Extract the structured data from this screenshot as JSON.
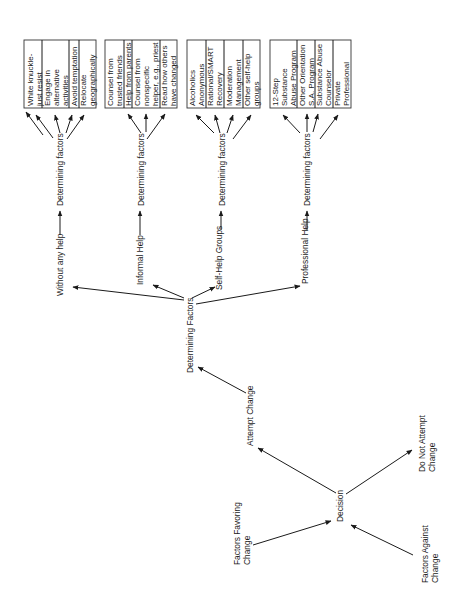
{
  "diagram": {
    "orientation": "rotated -90deg (text reads bottom to top)",
    "root_inputs": [
      {
        "id": "favoring",
        "label_lines": [
          "Factors Favoring",
          "Change"
        ]
      },
      {
        "id": "against",
        "label_lines": [
          "Factors Against",
          "Change"
        ]
      }
    ],
    "decision": {
      "label": "Decision"
    },
    "outcomes": [
      {
        "id": "attempt",
        "label_lines": [
          "Attempt Change"
        ]
      },
      {
        "id": "no_attempt",
        "label_lines": [
          "Do Not Attempt",
          "Change"
        ]
      }
    ],
    "central_node": {
      "label": "Determining Factors"
    },
    "branches": [
      {
        "label": "Without any help",
        "connector_label": "Determining factors",
        "options": [
          {
            "lines": [
              "White knuckle-",
              "just  resist"
            ]
          },
          {
            "lines": [
              "Engage in",
              "alternative",
              "activities"
            ]
          },
          {
            "lines": [
              "Avoid temptation"
            ]
          },
          {
            "lines": [
              "Relocate",
              "geographically"
            ]
          }
        ]
      },
      {
        "label": "Informal Help",
        "connector_label": "Determining factors",
        "options": [
          {
            "lines": [
              "Counsel from",
              "trusted friends"
            ]
          },
          {
            "lines": [
              "Help from parents"
            ]
          },
          {
            "lines": [
              "Counsel from",
              "nonspecific",
              "helper, e.g., priest"
            ]
          },
          {
            "lines": [
              "Read how others",
              "have changed"
            ]
          }
        ]
      },
      {
        "label": "Self-Help Groups",
        "connector_label": "Determining factors",
        "options": [
          {
            "lines": [
              "Alcoholics",
              "Anonymous"
            ]
          },
          {
            "lines": [
              "Rational/SMART",
              "Recovery"
            ]
          },
          {
            "lines": [
              "Moderation",
              "Management"
            ]
          },
          {
            "lines": [
              "Other self-help",
              "groups"
            ]
          }
        ]
      },
      {
        "label": "Professional Help",
        "connector_label": "Determining factors",
        "options": [
          {
            "lines": [
              "12-Step",
              "Substance",
              "Abuse Program"
            ]
          },
          {
            "lines": [
              "Other Orientation",
              "S.A. Program"
            ]
          },
          {
            "lines": [
              "Substance Abuse",
              "Counselor"
            ]
          },
          {
            "lines": [
              "Private",
              "Professional"
            ]
          }
        ]
      }
    ]
  },
  "colors": {
    "line": "#1a1a1a",
    "text": "#1a1a1a",
    "background": "#ffffff"
  }
}
